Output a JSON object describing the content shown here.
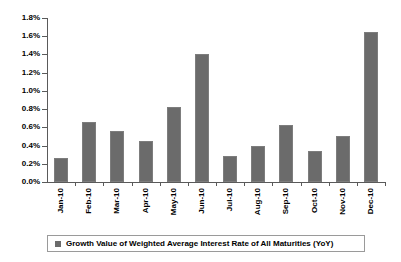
{
  "chart_data": {
    "type": "bar",
    "title": "",
    "subtitle": "",
    "xlabel": "",
    "ylabel": "",
    "ylim": [
      0.0,
      1.8
    ],
    "y_tick_step": 0.2,
    "y_tick_labels": [
      "0.0%",
      "0.2%",
      "0.4%",
      "0.6%",
      "0.8%",
      "1.0%",
      "1.2%",
      "1.4%",
      "1.6%",
      "1.8%"
    ],
    "y_tick_values": [
      0.0,
      0.2,
      0.4,
      0.6,
      0.8,
      1.0,
      1.2,
      1.4,
      1.6,
      1.8
    ],
    "grid": false,
    "legend_position": "bottom",
    "categories": [
      "Jan-10",
      "Feb-10",
      "Mar-10",
      "Apr-10",
      "May-10",
      "Jun-10",
      "Jul-10",
      "Aug-10",
      "Sep-10",
      "Oct-10",
      "Nov-10",
      "Dec-10"
    ],
    "series": [
      {
        "name": "Growth Value of Weighted Average Interest Rate of All Maturities (YoY)",
        "color": "#6b6b6b",
        "values": [
          0.26,
          0.66,
          0.56,
          0.45,
          0.82,
          1.41,
          0.29,
          0.4,
          0.63,
          0.34,
          0.5,
          1.65
        ]
      }
    ],
    "annotations": []
  },
  "legend": {
    "entries": [
      {
        "label": "Growth Value of Weighted Average Interest Rate of All Maturities (YoY)",
        "color": "#6b6b6b"
      }
    ]
  },
  "colors": {
    "bar": "#6b6b6b",
    "bar_border": "#7d7d7d",
    "axis": "#5a5a5a",
    "text": "#000000",
    "legend_border": "#9a9a9a",
    "background": "#ffffff"
  }
}
